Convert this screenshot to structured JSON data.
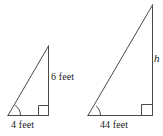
{
  "figure": {
    "background_color": "#ffffff",
    "line_color": "#4a4a4a",
    "text_color": "#1a1a1a"
  },
  "triangles": {
    "small": {
      "name": "small-triangle",
      "leg_vertical_label": "6 feet",
      "leg_vertical_value": 6,
      "base_label": "4 feet",
      "base_value": 4,
      "units": "feet",
      "right_angle_corner": "bottom-right",
      "marked_angle_corner": "bottom-left"
    },
    "large": {
      "name": "large-triangle",
      "leg_vertical_label": "h",
      "leg_vertical_value": null,
      "base_label": "44 feet",
      "base_value": 44,
      "units": "feet",
      "right_angle_corner": "bottom-right",
      "marked_angle_corner": "bottom-left"
    }
  }
}
